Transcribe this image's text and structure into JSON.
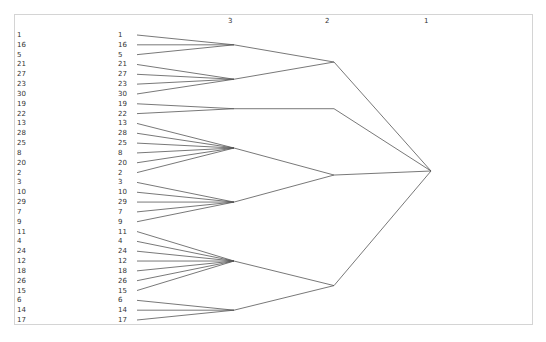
{
  "diagram": {
    "type": "hierarchical-cluster-tree",
    "level_headers": [
      "3",
      "2",
      "1"
    ],
    "leaves": [
      "1",
      "16",
      "5",
      "21",
      "27",
      "23",
      "30",
      "19",
      "22",
      "13",
      "28",
      "25",
      "8",
      "20",
      "2",
      "3",
      "10",
      "29",
      "7",
      "9",
      "11",
      "4",
      "24",
      "12",
      "18",
      "26",
      "15",
      "6",
      "14",
      "17"
    ],
    "clusters_level3": [
      {
        "id": "c3a",
        "members": [
          "1",
          "16",
          "5"
        ]
      },
      {
        "id": "c3b",
        "members": [
          "21",
          "27",
          "23",
          "30"
        ]
      },
      {
        "id": "c3c",
        "members": [
          "19",
          "22"
        ]
      },
      {
        "id": "c3d",
        "members": [
          "13",
          "28",
          "25",
          "8",
          "20",
          "2"
        ]
      },
      {
        "id": "c3e",
        "members": [
          "3",
          "10",
          "29",
          "7",
          "9"
        ]
      },
      {
        "id": "c3f",
        "members": [
          "11",
          "4",
          "24",
          "12",
          "18",
          "26",
          "15"
        ]
      },
      {
        "id": "c3g",
        "members": [
          "6",
          "14",
          "17"
        ]
      }
    ],
    "clusters_level2": [
      {
        "id": "c2a",
        "children": [
          "c3a",
          "c3b"
        ]
      },
      {
        "id": "c2b",
        "children": [
          "c3c"
        ]
      },
      {
        "id": "c2c",
        "children": [
          "c3d",
          "c3e"
        ]
      },
      {
        "id": "c2d",
        "children": [
          "c3f",
          "c3g"
        ]
      }
    ],
    "root": {
      "id": "c1",
      "children": [
        "c2a",
        "c2b",
        "c2c",
        "c2d"
      ]
    },
    "colors": {
      "line": "#555555",
      "text": "#333333",
      "border": "#d4d4d4"
    }
  }
}
